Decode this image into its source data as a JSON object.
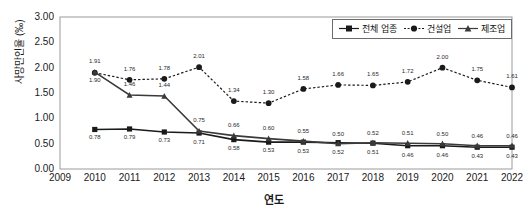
{
  "chart_data": {
    "type": "line",
    "title": "",
    "xlabel": "연도",
    "ylabel": "사망만인율 (‰)",
    "ylim": [
      0.0,
      3.0
    ],
    "ytick_step": 0.5,
    "grid": false,
    "legend_position": "top-right",
    "x": [
      2009,
      2010,
      2011,
      2012,
      2013,
      2014,
      2015,
      2016,
      2017,
      2018,
      2019,
      2020,
      2021,
      2022
    ],
    "categories": [
      "2009",
      "2010",
      "2011",
      "2012",
      "2013",
      "2014",
      "2015",
      "2016",
      "2017",
      "2018",
      "2019",
      "2020",
      "2021",
      "2022"
    ],
    "ytick_labels": [
      "0.00",
      "0.50",
      "1.00",
      "1.50",
      "2.00",
      "2.50",
      "3.00"
    ],
    "series": [
      {
        "name": "전체 업종",
        "marker": "square",
        "line": "solid",
        "color": "#1a1a1a",
        "x": [
          2010,
          2011,
          2012,
          2013,
          2014,
          2015,
          2016,
          2017,
          2018,
          2019,
          2020,
          2021,
          2022
        ],
        "values": [
          0.78,
          0.79,
          0.73,
          0.71,
          0.58,
          0.53,
          0.53,
          0.52,
          0.51,
          0.46,
          0.46,
          0.43,
          0.43
        ],
        "labels": [
          "0.78",
          "0.79",
          "0.73",
          "0.71",
          "0.58",
          "0.53",
          "0.53",
          "0.52",
          "0.51",
          "0.46",
          "0.46",
          "0.43",
          "0.43"
        ]
      },
      {
        "name": "건설업",
        "marker": "circle",
        "line": "dotted",
        "color": "#1a1a1a",
        "x": [
          2010,
          2011,
          2012,
          2013,
          2014,
          2015,
          2016,
          2017,
          2018,
          2019,
          2020,
          2021,
          2022
        ],
        "values": [
          1.9,
          1.76,
          1.78,
          2.01,
          1.34,
          1.3,
          1.58,
          1.66,
          1.65,
          1.72,
          2.0,
          1.75,
          1.61
        ],
        "labels": [
          "1.90",
          "1.76",
          "1.78",
          "2.01",
          "1.34",
          "1.30",
          "1.58",
          "1.66",
          "1.65",
          "1.72",
          "2.00",
          "1.75",
          "1.61"
        ]
      },
      {
        "name": "제조업",
        "marker": "triangle",
        "line": "solid",
        "color": "#3a3a3a",
        "x": [
          2010,
          2011,
          2012,
          2013,
          2014,
          2015,
          2016,
          2017,
          2018,
          2019,
          2020,
          2021,
          2022
        ],
        "values": [
          1.91,
          1.46,
          1.44,
          0.75,
          0.66,
          0.6,
          0.55,
          0.5,
          0.52,
          0.51,
          0.5,
          0.46,
          0.46
        ],
        "labels": [
          "1.91",
          "1.46",
          "1.44",
          "0.75",
          "0.66",
          "0.60",
          "0.55",
          "0.50",
          "0.52",
          "0.51",
          "0.50",
          "0.46",
          "0.46"
        ]
      }
    ]
  }
}
